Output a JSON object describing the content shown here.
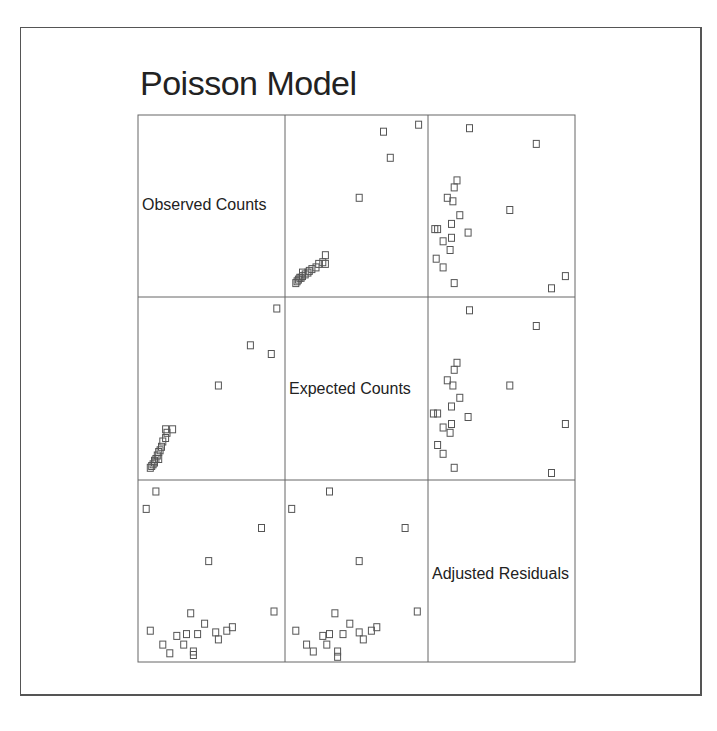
{
  "title": "Poisson Model",
  "chart_data": {
    "type": "scatter",
    "subtype": "scatterplot_matrix",
    "title": "Poisson Model",
    "variables": [
      "Observed Counts",
      "Expected Counts",
      "Adjusted Residuals"
    ],
    "marker": "open-square",
    "grid": false,
    "axes_ticks": "none",
    "note": "Approximate normalized positions (0-1, x left->right, y bottom->top) read from panels",
    "series": {
      "obs_vs_exp": [
        [
          0.06,
          0.05
        ],
        [
          0.07,
          0.06
        ],
        [
          0.08,
          0.07
        ],
        [
          0.09,
          0.09
        ],
        [
          0.1,
          0.1
        ],
        [
          0.11,
          0.12
        ],
        [
          0.12,
          0.14
        ],
        [
          0.13,
          0.15
        ],
        [
          0.14,
          0.17
        ],
        [
          0.15,
          0.2
        ],
        [
          0.17,
          0.22
        ],
        [
          0.18,
          0.25
        ],
        [
          0.22,
          0.27
        ],
        [
          0.17,
          0.27
        ],
        [
          0.55,
          0.52
        ],
        [
          0.78,
          0.75
        ],
        [
          0.93,
          0.7
        ],
        [
          0.97,
          0.96
        ],
        [
          0.12,
          0.1
        ],
        [
          0.09,
          0.08
        ]
      ],
      "obs_vs_resid": [
        [
          0.03,
          0.86
        ],
        [
          0.1,
          0.96
        ],
        [
          0.48,
          0.56
        ],
        [
          0.86,
          0.75
        ],
        [
          0.95,
          0.27
        ],
        [
          0.06,
          0.16
        ],
        [
          0.25,
          0.13
        ],
        [
          0.35,
          0.26
        ],
        [
          0.4,
          0.14
        ],
        [
          0.53,
          0.15
        ],
        [
          0.55,
          0.11
        ],
        [
          0.2,
          0.03
        ],
        [
          0.15,
          0.08
        ],
        [
          0.3,
          0.08
        ],
        [
          0.37,
          0.04
        ],
        [
          0.37,
          0.02
        ],
        [
          0.61,
          0.16
        ],
        [
          0.65,
          0.18
        ],
        [
          0.45,
          0.2
        ],
        [
          0.32,
          0.14
        ]
      ],
      "exp_vs_resid": [
        [
          0.02,
          0.86
        ],
        [
          0.3,
          0.96
        ],
        [
          0.52,
          0.56
        ],
        [
          0.86,
          0.75
        ],
        [
          0.95,
          0.27
        ],
        [
          0.05,
          0.16
        ],
        [
          0.25,
          0.13
        ],
        [
          0.34,
          0.26
        ],
        [
          0.4,
          0.14
        ],
        [
          0.52,
          0.15
        ],
        [
          0.55,
          0.11
        ],
        [
          0.18,
          0.04
        ],
        [
          0.13,
          0.08
        ],
        [
          0.28,
          0.08
        ],
        [
          0.36,
          0.04
        ],
        [
          0.36,
          0.01
        ],
        [
          0.61,
          0.16
        ],
        [
          0.65,
          0.18
        ],
        [
          0.45,
          0.2
        ],
        [
          0.3,
          0.14
        ]
      ]
    }
  }
}
